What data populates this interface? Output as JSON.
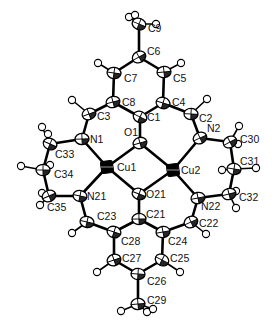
{
  "diagram": {
    "type": "ORTEP molecular structure",
    "atoms": [
      {
        "id": "Cu1",
        "label": "Cu1",
        "x": 107,
        "y": 167,
        "kind": "metal",
        "lx": 117,
        "ly": 171
      },
      {
        "id": "Cu2",
        "label": "Cu2",
        "x": 173,
        "y": 170,
        "kind": "metal",
        "lx": 181,
        "ly": 174
      },
      {
        "id": "O1",
        "label": "O1",
        "x": 140,
        "y": 143,
        "kind": "heavy",
        "lx": 138,
        "ly": 136,
        "lanchor": "end"
      },
      {
        "id": "O21",
        "label": "O21",
        "x": 139,
        "y": 194,
        "kind": "heavy",
        "lx": 146,
        "ly": 198
      },
      {
        "id": "N1",
        "label": "N1",
        "x": 82,
        "y": 139,
        "kind": "heavy",
        "lx": 90,
        "ly": 143
      },
      {
        "id": "N2",
        "label": "N2",
        "x": 200,
        "y": 138,
        "kind": "heavy",
        "lx": 207,
        "ly": 132
      },
      {
        "id": "N21",
        "label": "N21",
        "x": 80,
        "y": 196,
        "kind": "heavy",
        "lx": 87,
        "ly": 200
      },
      {
        "id": "N22",
        "label": "N22",
        "x": 198,
        "y": 198,
        "kind": "heavy",
        "lx": 201,
        "ly": 210
      },
      {
        "id": "C1",
        "label": "C1",
        "x": 140,
        "y": 117,
        "kind": "heavy",
        "lx": 147,
        "ly": 121
      },
      {
        "id": "C2",
        "label": "C2",
        "x": 191,
        "y": 114,
        "kind": "heavy",
        "lx": 199,
        "ly": 122
      },
      {
        "id": "C3",
        "label": "C3",
        "x": 89,
        "y": 114,
        "kind": "heavy",
        "lx": 97,
        "ly": 120
      },
      {
        "id": "C4",
        "label": "C4",
        "x": 163,
        "y": 103,
        "kind": "heavy",
        "lx": 172,
        "ly": 106
      },
      {
        "id": "C5",
        "label": "C5",
        "x": 164,
        "y": 72,
        "kind": "heavy",
        "lx": 173,
        "ly": 82
      },
      {
        "id": "C6",
        "label": "C6",
        "x": 139,
        "y": 57,
        "kind": "heavy",
        "lx": 147,
        "ly": 55
      },
      {
        "id": "C7",
        "label": "C7",
        "x": 114,
        "y": 73,
        "kind": "heavy",
        "lx": 124,
        "ly": 82
      },
      {
        "id": "C8",
        "label": "C8",
        "x": 113,
        "y": 102,
        "kind": "heavy",
        "lx": 122,
        "ly": 106
      },
      {
        "id": "C9",
        "label": "C9",
        "x": 139,
        "y": 24,
        "kind": "heavy",
        "lx": 148,
        "ly": 32
      },
      {
        "id": "C21",
        "label": "C21",
        "x": 139,
        "y": 219,
        "kind": "heavy",
        "lx": 146,
        "ly": 218
      },
      {
        "id": "C22",
        "label": "C22",
        "x": 191,
        "y": 222,
        "kind": "heavy",
        "lx": 199,
        "ly": 227
      },
      {
        "id": "C23",
        "label": "C23",
        "x": 87,
        "y": 222,
        "kind": "heavy",
        "lx": 97,
        "ly": 220
      },
      {
        "id": "C24",
        "label": "C24",
        "x": 163,
        "y": 232,
        "kind": "heavy",
        "lx": 168,
        "ly": 245
      },
      {
        "id": "C25",
        "label": "C25",
        "x": 162,
        "y": 260,
        "kind": "heavy",
        "lx": 170,
        "ly": 262
      },
      {
        "id": "C26",
        "label": "C26",
        "x": 138,
        "y": 274,
        "kind": "heavy",
        "lx": 147,
        "ly": 285
      },
      {
        "id": "C27",
        "label": "C27",
        "x": 114,
        "y": 260,
        "kind": "heavy",
        "lx": 122,
        "ly": 262
      },
      {
        "id": "C28",
        "label": "C28",
        "x": 114,
        "y": 232,
        "kind": "heavy",
        "lx": 121,
        "ly": 245
      },
      {
        "id": "C29",
        "label": "C29",
        "x": 138,
        "y": 304,
        "kind": "heavy",
        "lx": 147,
        "ly": 304
      },
      {
        "id": "C30",
        "label": "C30",
        "x": 230,
        "y": 142,
        "kind": "heavy",
        "lx": 240,
        "ly": 143
      },
      {
        "id": "C31",
        "label": "C31",
        "x": 234,
        "y": 169,
        "kind": "heavy",
        "lx": 240,
        "ly": 165
      },
      {
        "id": "C32",
        "label": "C32",
        "x": 229,
        "y": 194,
        "kind": "heavy",
        "lx": 239,
        "ly": 201
      },
      {
        "id": "C33",
        "label": "C33",
        "x": 50,
        "y": 144,
        "kind": "heavy",
        "lx": 55,
        "ly": 158
      },
      {
        "id": "C34",
        "label": "C34",
        "x": 43,
        "y": 170,
        "kind": "heavy",
        "lx": 54,
        "ly": 178
      },
      {
        "id": "C35",
        "label": "C35",
        "x": 49,
        "y": 196,
        "kind": "heavy",
        "lx": 47,
        "ly": 211
      }
    ],
    "hydrogens": [
      {
        "parent": "C9",
        "x": 129,
        "y": 17
      },
      {
        "parent": "C9",
        "x": 135,
        "y": 15
      },
      {
        "parent": "C9",
        "x": 156,
        "y": 24
      },
      {
        "parent": "C7",
        "x": 98,
        "y": 63
      },
      {
        "parent": "C5",
        "x": 181,
        "y": 63
      },
      {
        "parent": "C3",
        "x": 72,
        "y": 100
      },
      {
        "parent": "C2",
        "x": 207,
        "y": 99
      },
      {
        "parent": "C33",
        "x": 42,
        "y": 127
      },
      {
        "parent": "C33",
        "x": 48,
        "y": 134
      },
      {
        "parent": "C34",
        "x": 21,
        "y": 166
      },
      {
        "parent": "C34",
        "x": 50,
        "y": 165
      },
      {
        "parent": "C35",
        "x": 42,
        "y": 193
      },
      {
        "parent": "C35",
        "x": 40,
        "y": 205
      },
      {
        "parent": "C30",
        "x": 239,
        "y": 126
      },
      {
        "parent": "C30",
        "x": 238,
        "y": 144
      },
      {
        "parent": "C31",
        "x": 222,
        "y": 170
      },
      {
        "parent": "C31",
        "x": 256,
        "y": 168
      },
      {
        "parent": "C32",
        "x": 236,
        "y": 191
      },
      {
        "parent": "C32",
        "x": 236,
        "y": 208
      },
      {
        "parent": "C23",
        "x": 72,
        "y": 233
      },
      {
        "parent": "C22",
        "x": 206,
        "y": 234
      },
      {
        "parent": "C27",
        "x": 97,
        "y": 272
      },
      {
        "parent": "C25",
        "x": 180,
        "y": 272
      },
      {
        "parent": "C29",
        "x": 121,
        "y": 311
      },
      {
        "parent": "C29",
        "x": 147,
        "y": 312
      },
      {
        "parent": "C29",
        "x": 153,
        "y": 309
      }
    ],
    "bonds": [
      [
        "Cu1",
        "O1"
      ],
      [
        "Cu1",
        "O21"
      ],
      [
        "Cu2",
        "O1"
      ],
      [
        "Cu2",
        "O21"
      ],
      [
        "Cu1",
        "N1"
      ],
      [
        "Cu1",
        "N21"
      ],
      [
        "Cu2",
        "N2"
      ],
      [
        "Cu2",
        "N22"
      ],
      [
        "O1",
        "C1"
      ],
      [
        "C1",
        "C8"
      ],
      [
        "C1",
        "C4"
      ],
      [
        "C8",
        "C7"
      ],
      [
        "C7",
        "C6"
      ],
      [
        "C6",
        "C5"
      ],
      [
        "C5",
        "C4"
      ],
      [
        "C6",
        "C9"
      ],
      [
        "C8",
        "C3"
      ],
      [
        "C3",
        "N1"
      ],
      [
        "C4",
        "C2"
      ],
      [
        "C2",
        "N2"
      ],
      [
        "N1",
        "C33"
      ],
      [
        "C33",
        "C34"
      ],
      [
        "C34",
        "C35"
      ],
      [
        "C35",
        "N21"
      ],
      [
        "N2",
        "C30"
      ],
      [
        "C30",
        "C31"
      ],
      [
        "C31",
        "C32"
      ],
      [
        "C32",
        "N22"
      ],
      [
        "O21",
        "C21"
      ],
      [
        "C21",
        "C28"
      ],
      [
        "C21",
        "C24"
      ],
      [
        "C28",
        "C27"
      ],
      [
        "C27",
        "C26"
      ],
      [
        "C26",
        "C25"
      ],
      [
        "C25",
        "C24"
      ],
      [
        "C26",
        "C29"
      ],
      [
        "C28",
        "C23"
      ],
      [
        "C23",
        "N21"
      ],
      [
        "C24",
        "C22"
      ],
      [
        "C22",
        "N22"
      ]
    ]
  }
}
